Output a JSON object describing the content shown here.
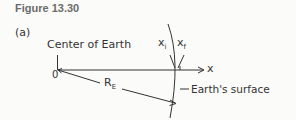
{
  "figure": {
    "title": "Figure 13.30",
    "panel_label": "(a)",
    "labels": {
      "center": "Center of Earth",
      "origin": "0",
      "axis": "x",
      "radius_main": "R",
      "radius_sub": "E",
      "xi_main": "x",
      "xi_sub": "i",
      "xf_main": "x",
      "xf_sub": "f",
      "surface": "Earth's surface"
    },
    "colors": {
      "ink": "#333333",
      "title": "#6b6b6b",
      "background": "#fbfbf9"
    }
  }
}
